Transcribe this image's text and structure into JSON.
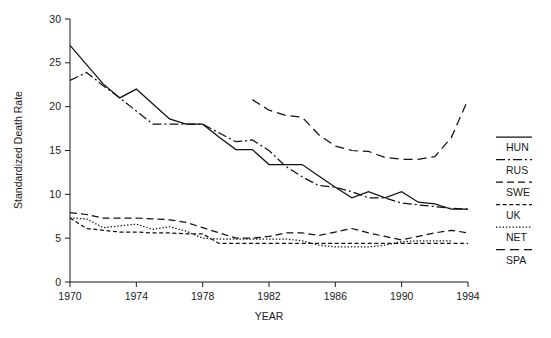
{
  "chart_data": {
    "type": "line",
    "title": "",
    "xlabel": "YEAR",
    "ylabel": "Standardized Death Rate",
    "xlim": [
      1970,
      1994
    ],
    "ylim": [
      0,
      30
    ],
    "xticks": [
      1970,
      1974,
      1978,
      1982,
      1986,
      1990,
      1994
    ],
    "yticks": [
      0,
      5,
      10,
      15,
      20,
      25,
      30
    ],
    "grid": false,
    "legend_position": "right",
    "x": [
      1970,
      1971,
      1972,
      1973,
      1974,
      1975,
      1976,
      1977,
      1978,
      1979,
      1980,
      1981,
      1982,
      1983,
      1984,
      1985,
      1986,
      1987,
      1988,
      1989,
      1990,
      1991,
      1992,
      1993,
      1994
    ],
    "series": [
      {
        "name": "HUN",
        "dash": "solid",
        "x": [
          1970,
          1971,
          1972,
          1973,
          1974,
          1975,
          1976,
          1977,
          1978,
          1979,
          1980,
          1981,
          1982,
          1983,
          1984,
          1985,
          1986,
          1987,
          1988,
          1989,
          1990,
          1991,
          1992,
          1993,
          1994
        ],
        "values": [
          27.0,
          24.8,
          22.6,
          21.0,
          22.0,
          20.3,
          18.6,
          18.0,
          18.0,
          16.5,
          15.1,
          15.1,
          13.4,
          13.4,
          13.4,
          12.1,
          10.8,
          9.6,
          10.3,
          9.6,
          10.3,
          9.1,
          8.9,
          8.3,
          8.3
        ]
      },
      {
        "name": "RUS",
        "dash": "dashdot",
        "x": [
          1970,
          1971,
          1972,
          1973,
          1974,
          1975,
          1976,
          1977,
          1978,
          1979,
          1980,
          1981,
          1982,
          1983,
          1984,
          1985,
          1986,
          1987,
          1988,
          1989,
          1990,
          1991,
          1992,
          1993,
          1994
        ],
        "values": [
          23.0,
          23.9,
          22.4,
          21.0,
          19.5,
          18.0,
          18.0,
          18.0,
          18.0,
          17.0,
          16.0,
          16.2,
          15.0,
          13.2,
          12.0,
          11.0,
          10.8,
          10.3,
          9.6,
          9.6,
          9.0,
          8.8,
          8.6,
          8.4,
          8.3
        ]
      },
      {
        "name": "SWE",
        "dash": "dashed",
        "x": [
          1970,
          1971,
          1972,
          1973,
          1974,
          1975,
          1976,
          1977,
          1978,
          1979,
          1980,
          1981,
          1982,
          1983,
          1984,
          1985,
          1986,
          1987,
          1988,
          1989,
          1990,
          1991,
          1992,
          1993,
          1994
        ],
        "values": [
          7.9,
          7.7,
          7.3,
          7.3,
          7.3,
          7.2,
          7.1,
          6.8,
          6.2,
          5.6,
          5.0,
          5.0,
          5.2,
          5.6,
          5.6,
          5.3,
          5.7,
          6.1,
          5.6,
          5.2,
          4.8,
          5.2,
          5.6,
          5.9,
          5.6
        ]
      },
      {
        "name": "UK",
        "dash": "shortdash",
        "x": [
          1970,
          1971,
          1972,
          1973,
          1974,
          1975,
          1976,
          1977,
          1978,
          1979,
          1980,
          1981,
          1982,
          1983,
          1984,
          1985,
          1986,
          1987,
          1988,
          1989,
          1990,
          1991,
          1992,
          1993,
          1994
        ],
        "values": [
          7.3,
          6.1,
          5.9,
          5.7,
          5.7,
          5.6,
          5.6,
          5.5,
          5.5,
          4.4,
          4.4,
          4.4,
          4.4,
          4.4,
          4.4,
          4.4,
          4.4,
          4.4,
          4.4,
          4.4,
          4.4,
          4.4,
          4.4,
          4.4,
          4.4
        ]
      },
      {
        "name": "NET",
        "dash": "dotted",
        "x": [
          1970,
          1971,
          1972,
          1973,
          1974,
          1975,
          1976,
          1977,
          1978,
          1979,
          1980,
          1981,
          1982,
          1983,
          1984,
          1985,
          1986,
          1987,
          1988,
          1989,
          1990,
          1991,
          1992,
          1993
        ],
        "values": [
          7.3,
          7.2,
          6.2,
          6.4,
          6.6,
          6.0,
          6.3,
          5.8,
          5.0,
          4.9,
          4.9,
          4.9,
          4.9,
          4.9,
          4.7,
          4.2,
          4.0,
          4.0,
          4.0,
          4.2,
          4.6,
          4.7,
          4.7,
          4.7
        ]
      },
      {
        "name": "SPA",
        "dash": "longdash",
        "x": [
          1981,
          1982,
          1983,
          1984,
          1985,
          1986,
          1987,
          1988,
          1989,
          1990,
          1991,
          1992,
          1993,
          1994
        ],
        "values": [
          20.8,
          19.6,
          19.0,
          18.8,
          16.8,
          15.5,
          15.0,
          14.9,
          14.2,
          14.0,
          14.0,
          14.3,
          16.5,
          20.8
        ]
      }
    ]
  },
  "axis": {
    "ylabel": "Standardized Death Rate",
    "xlabel": "YEAR",
    "ytick_labels": [
      "0",
      "5",
      "10",
      "15",
      "20",
      "25",
      "30"
    ],
    "xtick_labels": [
      "1970",
      "1974",
      "1978",
      "1982",
      "1986",
      "1990",
      "1994"
    ]
  },
  "legend": {
    "entries": [
      {
        "label": "HUN",
        "dash": "solid"
      },
      {
        "label": "RUS",
        "dash": "dashdot"
      },
      {
        "label": "SWE",
        "dash": "dashed"
      },
      {
        "label": "UK",
        "dash": "shortdash"
      },
      {
        "label": "NET",
        "dash": "dotted"
      },
      {
        "label": "SPA",
        "dash": "longdash"
      }
    ]
  }
}
